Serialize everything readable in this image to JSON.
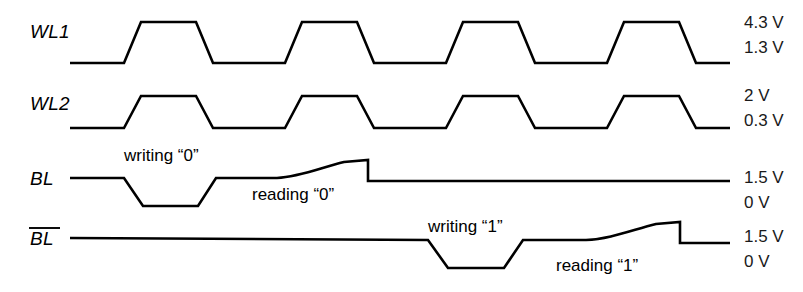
{
  "figure": {
    "background_color": "#ffffff",
    "trace_color": "#000000",
    "width": 803,
    "height": 292
  },
  "signals": [
    {
      "name": "WL1",
      "label": "WL1",
      "high_label": "4.3 V",
      "low_label": "1.3 V",
      "kind": "clock",
      "pulses": 4,
      "path": "M 70,63 L 124,63 L 141,22 L 196,22 L 213,63 L 285,63 L 302,22 L 357,22 L 374,63 L 446,63 L 463,22 L 518,22 L 535,63 L 607,63 L 624,22 L 679,22 L 696,63 L 730,63"
    },
    {
      "name": "WL2",
      "label": "WL2",
      "high_label": "2 V",
      "low_label": "0.3 V",
      "kind": "clock",
      "pulses": 4,
      "path": "M 70,128 L 124,128 L 141,96 L 196,96 L 213,128 L 285,128 L 302,96 L 357,96 L 374,128 L 446,128 L 463,96 L 518,96 L 535,128 L 607,128 L 624,96 L 679,96 L 696,128 L 730,128"
    },
    {
      "name": "BL",
      "label": "BL",
      "overbar": false,
      "high_label": "1.5 V",
      "low_label": "0 V",
      "kind": "data",
      "path": "M 70,178 L 124,178 L 143,206 L 198,206 L 216,178 L 277,178 C 300,177 320,168 344,162 L 368,160 L 368,181 L 730,181"
    },
    {
      "name": "BLbar",
      "label": "BL",
      "overbar": true,
      "high_label": "1.5 V",
      "low_label": "0 V",
      "kind": "data",
      "path": "M 70,238 L 428,240 L 448,268 L 504,268 L 523,240 L 586,240 L 586,240 C 610,239 632,230 656,224 L 680,222 L 680,243 L 730,243"
    }
  ],
  "annotations": [
    {
      "text": "writing “0”",
      "x": 124,
      "y": 161,
      "anchor": "start",
      "signal": "BL"
    },
    {
      "text": "reading “0”",
      "x": 252,
      "y": 200,
      "anchor": "start",
      "signal": "BL"
    },
    {
      "text": "writing “1”",
      "x": 428,
      "y": 232,
      "anchor": "start",
      "signal": "BLbar"
    },
    {
      "text": "reading “1”",
      "x": 556,
      "y": 271,
      "anchor": "start",
      "signal": "BLbar"
    }
  ],
  "label_positions": {
    "signal_label_x": 30,
    "voltage_label_x": 744,
    "wl1": {
      "label_y": 38,
      "high_y": 28,
      "low_y": 53
    },
    "wl2": {
      "label_y": 110,
      "high_y": 101,
      "low_y": 126
    },
    "bl": {
      "label_y": 185,
      "high_y": 183,
      "low_y": 208
    },
    "blbar": {
      "label_y": 245,
      "high_y": 242,
      "low_y": 267
    }
  }
}
